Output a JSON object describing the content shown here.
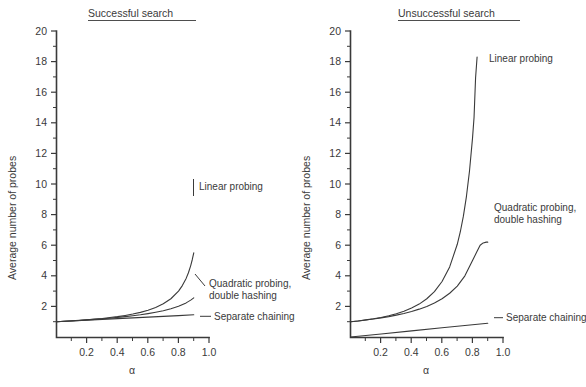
{
  "figure": {
    "background": "#ffffff",
    "ink": "#3a3a3a",
    "alpha_symbol": "α",
    "y_axis_label": "Average number of probes"
  },
  "chart_data": [
    {
      "type": "line",
      "title": "Successful search",
      "xlabel": "α",
      "ylabel": "Average number of probes",
      "xlim": [
        0,
        1.05
      ],
      "ylim": [
        0,
        20
      ],
      "grid": false,
      "legend": "inline-annotations",
      "xticks": [
        0.2,
        0.4,
        0.6,
        0.8,
        1.0
      ],
      "xticklabels": [
        "0.2",
        "0.4",
        "0.6",
        "0.8",
        "1.0"
      ],
      "yticks": [
        2,
        4,
        6,
        8,
        10,
        12,
        14,
        16,
        18,
        20
      ],
      "yticklabels": [
        "2",
        "4",
        "6",
        "8",
        "10",
        "12",
        "14",
        "16",
        "18",
        "20"
      ],
      "series": [
        {
          "name": "Linear probing",
          "formula": "0.5*(1 + 1/(1-alpha))",
          "x": [
            0.0,
            0.05,
            0.1,
            0.15,
            0.2,
            0.25,
            0.3,
            0.35,
            0.4,
            0.45,
            0.5,
            0.55,
            0.6,
            0.65,
            0.7,
            0.75,
            0.8,
            0.825,
            0.85,
            0.865,
            0.88,
            0.89,
            0.9
          ],
          "y": [
            1.0,
            1.03,
            1.06,
            1.09,
            1.13,
            1.17,
            1.21,
            1.27,
            1.33,
            1.41,
            1.5,
            1.61,
            1.75,
            1.93,
            2.17,
            2.5,
            3.0,
            3.36,
            3.83,
            4.2,
            4.67,
            5.05,
            5.5
          ]
        },
        {
          "name": "Quadratic probing, double hashing",
          "formula": "-ln(1-alpha)/alpha",
          "x": [
            0.0,
            0.05,
            0.1,
            0.15,
            0.2,
            0.25,
            0.3,
            0.35,
            0.4,
            0.45,
            0.5,
            0.55,
            0.6,
            0.65,
            0.7,
            0.75,
            0.8,
            0.85,
            0.88,
            0.9
          ],
          "y": [
            1.0,
            1.03,
            1.05,
            1.08,
            1.12,
            1.15,
            1.19,
            1.23,
            1.28,
            1.33,
            1.39,
            1.45,
            1.53,
            1.62,
            1.72,
            1.85,
            2.01,
            2.23,
            2.41,
            2.56
          ]
        },
        {
          "name": "Separate chaining",
          "formula": "1 + alpha/2",
          "x": [
            0.0,
            0.2,
            0.4,
            0.6,
            0.8,
            0.9
          ],
          "y": [
            1.0,
            1.1,
            1.2,
            1.3,
            1.4,
            1.45
          ]
        }
      ],
      "annotations": [
        {
          "text": "Linear probing",
          "at_x": 0.93,
          "at_y": 10.1
        },
        {
          "text": "Quadratic probing,",
          "at_x": 0.93,
          "at_y": 3.3
        },
        {
          "text": "double hashing",
          "at_x": 0.93,
          "at_y": 2.6
        },
        {
          "text": "Separate chaining",
          "at_x": 0.93,
          "at_y": 1.45
        }
      ]
    },
    {
      "type": "line",
      "title": "Unsuccessful search",
      "xlabel": "α",
      "ylabel": "Average number of probes",
      "xlim": [
        0,
        1.05
      ],
      "ylim": [
        0,
        20
      ],
      "grid": false,
      "legend": "inline-annotations",
      "xticks": [
        0.2,
        0.4,
        0.6,
        0.8,
        1.0
      ],
      "xticklabels": [
        "0.2",
        "0.4",
        "0.6",
        "0.8",
        "1.0"
      ],
      "yticks": [
        2,
        4,
        6,
        8,
        10,
        12,
        14,
        16,
        18,
        20
      ],
      "yticklabels": [
        "2",
        "4",
        "6",
        "8",
        "10",
        "12",
        "14",
        "16",
        "18",
        "20"
      ],
      "series": [
        {
          "name": "Linear probing",
          "formula": "0.5*(1 + 1/(1-alpha)^2)",
          "x": [
            0.0,
            0.05,
            0.1,
            0.15,
            0.2,
            0.25,
            0.3,
            0.35,
            0.4,
            0.45,
            0.5,
            0.55,
            0.6,
            0.65,
            0.7,
            0.72,
            0.74,
            0.76,
            0.78,
            0.8,
            0.81,
            0.82,
            0.83
          ],
          "y": [
            1.0,
            1.05,
            1.12,
            1.19,
            1.28,
            1.39,
            1.52,
            1.68,
            1.89,
            2.15,
            2.5,
            2.97,
            3.63,
            4.58,
            6.06,
            6.88,
            7.9,
            9.18,
            10.83,
            13.0,
            14.35,
            16.93,
            18.3
          ]
        },
        {
          "name": "Quadratic probing, double hashing",
          "formula": "1/(1-alpha)",
          "x": [
            0.0,
            0.05,
            0.1,
            0.15,
            0.2,
            0.25,
            0.3,
            0.35,
            0.4,
            0.45,
            0.5,
            0.55,
            0.6,
            0.65,
            0.7,
            0.75,
            0.8,
            0.83,
            0.85,
            0.87,
            0.89,
            0.9
          ],
          "y": [
            1.0,
            1.05,
            1.11,
            1.18,
            1.25,
            1.33,
            1.43,
            1.54,
            1.67,
            1.82,
            2.0,
            2.22,
            2.5,
            2.86,
            3.33,
            4.0,
            5.0,
            5.6,
            6.0,
            6.15,
            6.2,
            6.2
          ]
        },
        {
          "name": "Separate chaining",
          "formula": "alpha",
          "x": [
            0.0,
            0.2,
            0.4,
            0.6,
            0.8,
            0.9
          ],
          "y": [
            0.0,
            0.2,
            0.4,
            0.6,
            0.8,
            0.9
          ]
        }
      ],
      "annotations": [
        {
          "text": "Linear probing",
          "at_x": 0.88,
          "at_y": 18.3
        },
        {
          "text": "Quadratic probing,",
          "at_x": 0.93,
          "at_y": 6.4
        },
        {
          "text": "double hashing",
          "at_x": 0.93,
          "at_y": 5.6
        },
        {
          "text": "Separate chaining",
          "at_x": 0.93,
          "at_y": 1.05
        }
      ]
    }
  ]
}
